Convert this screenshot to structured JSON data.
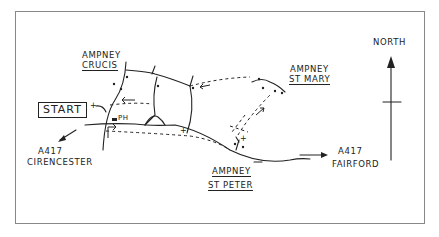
{
  "map": {
    "labels": {
      "start": "START",
      "ampney_crucis_1": "AMPNEY",
      "ampney_crucis_2": "CRUCIS",
      "ampney_st_mary_1": "AMPNEY",
      "ampney_st_mary_2": "ST MARY",
      "ampney_st_peter_1": "AMPNEY",
      "ampney_st_peter_2": "ST PETER",
      "a417_west_1": "A417",
      "a417_west_2": "CIRENCESTER",
      "a417_east_1": "A417",
      "a417_east_2": "FAIRFORD",
      "pub": "PH",
      "north": "NORTH"
    },
    "colors": {
      "ink": "#222222",
      "frame": "#888888",
      "background": "#ffffff"
    }
  }
}
